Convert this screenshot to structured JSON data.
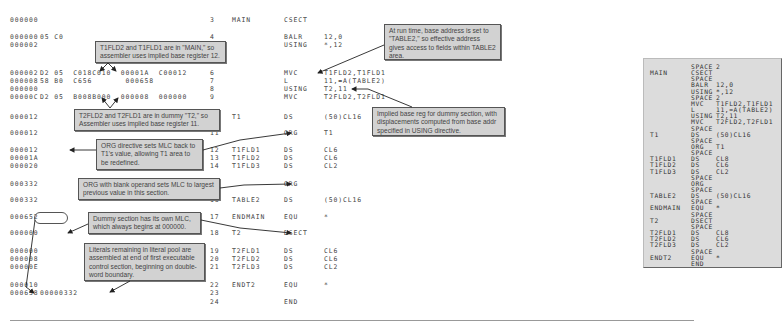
{
  "listing": {
    "rows": [
      {
        "loc": "000000",
        "obj": "",
        "stmt": "3",
        "label": "MAIN",
        "op": "CSECT",
        "operand": "",
        "y": 20
      },
      {
        "loc": "000000",
        "obj": "05 C0",
        "stmt": "4",
        "label": "",
        "op": "BALR",
        "operand": "12,0",
        "y": 37
      },
      {
        "loc": "000002",
        "obj": "",
        "stmt": "5",
        "label": "",
        "op": "USING",
        "operand": "*,12",
        "y": 45
      },
      {
        "loc": "000002",
        "obj": "D2 05  C018C010  00001A  C00012",
        "stmt": "6",
        "label": "",
        "op": "MVC",
        "operand": "T1FLD2,T1FLD1",
        "y": 73
      },
      {
        "loc": "000008",
        "obj": "58 B0  C656       000658",
        "stmt": "7",
        "label": "",
        "op": "L",
        "operand": "11,=A(TABLE2)",
        "y": 81
      },
      {
        "loc": "000000",
        "obj": "",
        "stmt": "8",
        "label": "",
        "op": "USING",
        "operand": "T2,11",
        "y": 89
      },
      {
        "loc": "00000C",
        "obj": "D2 05  B008B000  000008  000000",
        "stmt": "9",
        "label": "",
        "op": "MVC",
        "operand": "T2FLD2,T2FLD1",
        "y": 97
      },
      {
        "loc": "000012",
        "obj": "",
        "stmt": "10",
        "label": "T1",
        "op": "DS",
        "operand": "(50)CL16",
        "y": 117
      },
      {
        "loc": "000012",
        "obj": "",
        "stmt": "11",
        "label": "",
        "op": "ORG",
        "operand": "T1",
        "y": 133
      },
      {
        "loc": "000012",
        "obj": "",
        "stmt": "12",
        "label": "T1FLD1",
        "op": "DS",
        "operand": "CL6",
        "y": 150
      },
      {
        "loc": "00001A",
        "obj": "",
        "stmt": "13",
        "label": "T1FLD2",
        "op": "DS",
        "operand": "CL6",
        "y": 158
      },
      {
        "loc": "000020",
        "obj": "",
        "stmt": "14",
        "label": "T1FLD3",
        "op": "DS",
        "operand": "CL2",
        "y": 166
      },
      {
        "loc": "000332",
        "obj": "",
        "stmt": "15",
        "label": "",
        "op": "ORG",
        "operand": "",
        "y": 184
      },
      {
        "loc": "000332",
        "obj": "",
        "stmt": "16",
        "label": "TABLE2",
        "op": "DS",
        "operand": "(50)CL16",
        "y": 200
      },
      {
        "loc": "000652",
        "obj": "",
        "stmt": "17",
        "label": "ENDMAIN",
        "op": "EQU",
        "operand": "*",
        "y": 217
      },
      {
        "loc": "000000",
        "obj": "",
        "stmt": "18",
        "label": "T2",
        "op": "DSECT",
        "operand": "",
        "y": 233
      },
      {
        "loc": "000000",
        "obj": "",
        "stmt": "19",
        "label": "T2FLD1",
        "op": "DS",
        "operand": "CL6",
        "y": 251
      },
      {
        "loc": "000008",
        "obj": "",
        "stmt": "20",
        "label": "T2FLD2",
        "op": "DS",
        "operand": "CL6",
        "y": 259
      },
      {
        "loc": "00000E",
        "obj": "",
        "stmt": "21",
        "label": "T2FLD3",
        "op": "DS",
        "operand": "CL2",
        "y": 267
      },
      {
        "loc": "000010",
        "obj": "",
        "stmt": "22",
        "label": "ENDT2",
        "op": "EQU",
        "operand": "*",
        "y": 285
      },
      {
        "loc": "000658",
        "obj": "00000332",
        "stmt": "23",
        "label": "",
        "op": "",
        "operand": "",
        "y": 293
      },
      {
        "loc": "",
        "obj": "",
        "stmt": "24",
        "label": "",
        "op": "END",
        "operand": "",
        "y": 302
      }
    ]
  },
  "callouts": {
    "c1": "T1FLD2 and T1FLD1 are in \"MAIN,\" so assembler uses implied base register 12.",
    "c2": "At run time, base address is set to \"TABLE2,\" so effective address gives access to fields within TABLE2 area.",
    "c3": "T2FLD2 and T2FLD1 are in dummy \"T2,\" so Assembler uses implied base register 11.",
    "c4": "ORG directive sets MLC back to T1's value, allowing T1 area to be redefined.",
    "c5": "Implied base reg for dummy section, with displacements computed from base addr specified in USING directive.",
    "c6": "ORG with blank operand sets MLC to largest previous value in this section.",
    "c7": "Dummy section has its own MLC, which always begins at 000000.",
    "c8": "Literals remaining in literal pool are assembled at end of first executable control section, beginning on double-word boundary."
  },
  "source_panel": {
    "rows": [
      {
        "label": "",
        "op": "SPACE",
        "operand": "2"
      },
      {
        "label": "MAIN",
        "op": "CSECT",
        "operand": ""
      },
      {
        "label": "",
        "op": "SPACE",
        "operand": ""
      },
      {
        "label": "",
        "op": "BALR",
        "operand": "12,0"
      },
      {
        "label": "",
        "op": "USING",
        "operand": "*,12"
      },
      {
        "label": "",
        "op": "SPACE",
        "operand": "2"
      },
      {
        "label": "",
        "op": "MVC",
        "operand": "T1FLD2,T1FLD1"
      },
      {
        "label": "",
        "op": "L",
        "operand": "11,=A(TABLE2)"
      },
      {
        "label": "",
        "op": "USING",
        "operand": "T2,11"
      },
      {
        "label": "",
        "op": "MVC",
        "operand": "T2FLD2,T2FLD1"
      },
      {
        "label": "",
        "op": "SPACE",
        "operand": ""
      },
      {
        "label": "T1",
        "op": "DS",
        "operand": "(50)CL16"
      },
      {
        "label": "",
        "op": "SPACE",
        "operand": ""
      },
      {
        "label": "",
        "op": "ORG",
        "operand": "T1"
      },
      {
        "label": "",
        "op": "SPACE",
        "operand": ""
      },
      {
        "label": "T1FLD1",
        "op": "DS",
        "operand": "CL8"
      },
      {
        "label": "T1FLD2",
        "op": "DS",
        "operand": "CL6"
      },
      {
        "label": "T1FLD3",
        "op": "DS",
        "operand": "CL2"
      },
      {
        "label": "",
        "op": "SPACE",
        "operand": ""
      },
      {
        "label": "",
        "op": "ORG",
        "operand": ""
      },
      {
        "label": "",
        "op": "SPACE",
        "operand": ""
      },
      {
        "label": "TABLE2",
        "op": "DS",
        "operand": "(50)CL16"
      },
      {
        "label": "",
        "op": "SPACE",
        "operand": ""
      },
      {
        "label": "ENDMAIN",
        "op": "EQU",
        "operand": "*"
      },
      {
        "label": "",
        "op": "SPACE",
        "operand": ""
      },
      {
        "label": "T2",
        "op": "DSECT",
        "operand": ""
      },
      {
        "label": "",
        "op": "SPACE",
        "operand": ""
      },
      {
        "label": "T2FLD1",
        "op": "DS",
        "operand": "CL8"
      },
      {
        "label": "T2FLD2",
        "op": "DS",
        "operand": "CL6"
      },
      {
        "label": "T2FLD3",
        "op": "DS",
        "operand": "CL2"
      },
      {
        "label": "",
        "op": "SPACE",
        "operand": ""
      },
      {
        "label": "ENDT2",
        "op": "EQU",
        "operand": "*"
      },
      {
        "label": "",
        "op": "END",
        "operand": ""
      }
    ]
  }
}
